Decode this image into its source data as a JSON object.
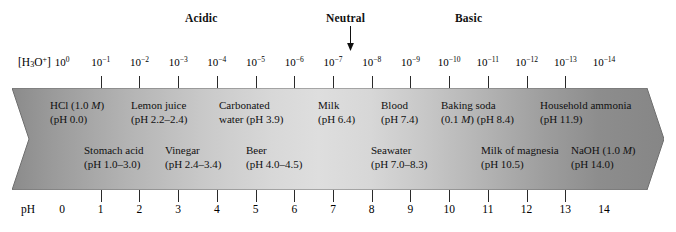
{
  "headers": {
    "acidic": "Acidic",
    "neutral": "Neutral",
    "basic": "Basic"
  },
  "axes": {
    "concentration_label_html": "[H<sub>3</sub>O<sup>+</sup>]",
    "concentration_label_text": "[H3O+]",
    "ph_label": "pH",
    "exponent_ticks": [
      "10<sup>0</sup>",
      "10<sup>-1</sup>",
      "10<sup>-2</sup>",
      "10<sup>-3</sup>",
      "10<sup>-4</sup>",
      "10<sup>-5</sup>",
      "10<sup>-6</sup>",
      "10<sup>-7</sup>",
      "10<sup>-8</sup>",
      "10<sup>-9</sup>",
      "10<sup>-10</sup>",
      "10<sup>-11</sup>",
      "10<sup>-12</sup>",
      "10<sup>-13</sup>",
      "10<sup>-14</sup>"
    ],
    "ph_ticks": [
      "0",
      "1",
      "2",
      "3",
      "4",
      "5",
      "6",
      "7",
      "8",
      "9",
      "10",
      "11",
      "12",
      "13",
      "14"
    ]
  },
  "substances_top": [
    {
      "line1": "HCl (1.0 <i>M</i>)",
      "line2": "(pH 0.0)",
      "ph": 0.0
    },
    {
      "line1": "Lemon juice",
      "line2": "(pH 2.2–2.4)",
      "ph": 2.3
    },
    {
      "line1": "Carbonated",
      "line2": "water (pH 3.9)",
      "ph": 3.9
    },
    {
      "line1": "Milk",
      "line2": "(pH 6.4)",
      "ph": 6.4
    },
    {
      "line1": "Blood",
      "line2": "(pH 7.4)",
      "ph": 7.4
    },
    {
      "line1": "Baking soda",
      "line2": "(0.1 <i>M</i>) (pH 8.4)",
      "ph": 8.4
    },
    {
      "line1": "Household ammonia",
      "line2": "(pH 11.9)",
      "ph": 11.9
    }
  ],
  "substances_bottom": [
    {
      "line1": "Stomach acid",
      "line2": "(pH 1.0–3.0)",
      "ph": 2.0
    },
    {
      "line1": "Vinegar",
      "line2": "(pH 2.4–3.4)",
      "ph": 2.9
    },
    {
      "line1": "Beer",
      "line2": "(pH 4.0–4.5)",
      "ph": 4.25
    },
    {
      "line1": "Seawater",
      "line2": "(pH 7.0–8.3)",
      "ph": 7.6
    },
    {
      "line1": "Milk of magnesia",
      "line2": "(pH 10.5)",
      "ph": 10.5
    },
    {
      "line1": "NaOH (1.0 <i>M</i>)",
      "line2": "(pH 14.0)",
      "ph": 14.0
    }
  ],
  "colors": {
    "band_left": "#8b8b8b",
    "band_mid": "#dedede",
    "band_right": "#868686",
    "text": "#111111",
    "tick": "#2a2a2a"
  }
}
